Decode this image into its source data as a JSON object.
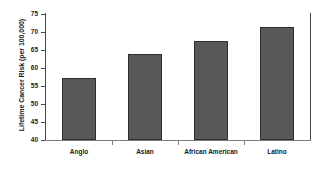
{
  "chart_data": {
    "type": "bar",
    "title": "",
    "subtitle": "",
    "xlabel": "",
    "ylabel": "Lifetime Cancer Risk (per 100,000)",
    "categories": [
      "Anglo",
      "Asian",
      "African American",
      "Latino"
    ],
    "values": [
      57.1,
      64.0,
      67.5,
      71.4
    ],
    "series": [
      {
        "name": "Lifetime Cancer Risk",
        "values": [
          57.1,
          64.0,
          67.5,
          71.4
        ]
      }
    ],
    "ylim": [
      40,
      75
    ],
    "yticks": [
      40,
      45,
      50,
      55,
      60,
      65,
      70,
      75
    ],
    "ytick_labels": [
      "40",
      "45",
      "50",
      "55",
      "60",
      "65",
      "70",
      "75"
    ],
    "grid": false,
    "legend": false,
    "legend_position": "none",
    "bar_color": "#585858",
    "bar_edge_color": "#2e2e2e",
    "axis_color": "#4a4a4a",
    "text_color": "#1a1a1a",
    "background_color": "#ffffff",
    "annotations": []
  }
}
